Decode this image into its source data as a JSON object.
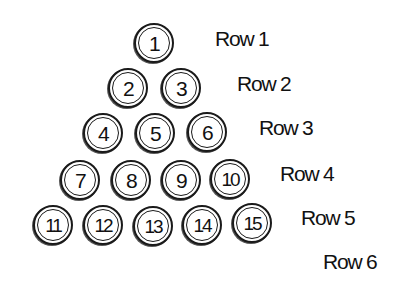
{
  "diagram": {
    "type": "triangular arrangement of numbered balls",
    "rows": [
      {
        "label": "Row 1",
        "balls": [
          "1"
        ]
      },
      {
        "label": "Row 2",
        "balls": [
          "2",
          "3"
        ]
      },
      {
        "label": "Row 3",
        "balls": [
          "4",
          "5",
          "6"
        ]
      },
      {
        "label": "Row 4",
        "balls": [
          "7",
          "8",
          "9",
          "10"
        ]
      },
      {
        "label": "Row 5",
        "balls": [
          "11",
          "12",
          "13",
          "14",
          "15"
        ]
      },
      {
        "label": "Row 6",
        "balls": []
      }
    ]
  }
}
